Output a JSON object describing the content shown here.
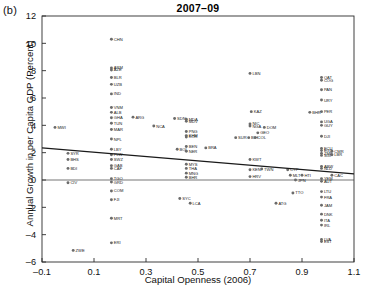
{
  "panel": {
    "label": "(b)"
  },
  "chart_data": {
    "type": "scatter",
    "title": "2007–09",
    "xlabel": "Capital Openness (2006)",
    "ylabel": "Annual Growth in per Capita GDP (Percent)",
    "xlim": [
      -0.1,
      1.1
    ],
    "ylim": [
      -6,
      12
    ],
    "xticks": [
      "–0.1",
      "0.1",
      "0.3",
      "0.5",
      "0.7",
      "0.9",
      "1.1"
    ],
    "xtick_values": [
      -0.1,
      0.1,
      0.3,
      0.5,
      0.7,
      0.9,
      1.1
    ],
    "yticks": [
      "12",
      "10",
      "8",
      "6",
      "4",
      "2",
      "0",
      "–2",
      "–4",
      "–6"
    ],
    "ytick_values": [
      12,
      10,
      8,
      6,
      4,
      2,
      0,
      -2,
      -4,
      -6
    ],
    "grid": false,
    "legend": null,
    "marker_color": "#6b6b6b",
    "line_color": "#1a1a1a",
    "trendline": {
      "x0": -0.1,
      "y0": 2.35,
      "x1": 1.1,
      "y1": 0.45
    },
    "zero_line": {
      "y": 0
    },
    "points": [
      {
        "label": "CHN",
        "x": 0.167,
        "y": 10.3
      },
      {
        "label": "ARM",
        "x": 0.167,
        "y": 8.2
      },
      {
        "label": "AZE",
        "x": 0.167,
        "y": 8.05
      },
      {
        "label": "BLR",
        "x": 0.167,
        "y": 7.5
      },
      {
        "label": "UZB",
        "x": 0.167,
        "y": 7.0
      },
      {
        "label": "IND",
        "x": 0.167,
        "y": 6.3
      },
      {
        "label": "VNM",
        "x": 0.167,
        "y": 5.3
      },
      {
        "label": "ALB",
        "x": 0.167,
        "y": 4.95
      },
      {
        "label": "GHA",
        "x": 0.167,
        "y": 4.55
      },
      {
        "label": "TUN",
        "x": 0.167,
        "y": 4.15
      },
      {
        "label": "MAR",
        "x": 0.167,
        "y": 3.7
      },
      {
        "label": "NPL",
        "x": 0.167,
        "y": 3.0
      },
      {
        "label": "ARG",
        "x": 0.25,
        "y": 4.6
      },
      {
        "label": "NCA",
        "x": 0.33,
        "y": 3.95
      },
      {
        "label": "LBY",
        "x": 0.167,
        "y": 2.25
      },
      {
        "label": "PLW",
        "x": 0.167,
        "y": 1.85
      },
      {
        "label": "SWZ",
        "x": 0.167,
        "y": 1.5
      },
      {
        "label": "GAB",
        "x": 0.167,
        "y": 1.05
      },
      {
        "label": "CAF",
        "x": 0.167,
        "y": 0.85
      },
      {
        "label": "TGO",
        "x": 0.167,
        "y": 0.1
      },
      {
        "label": "GRD",
        "x": 0.167,
        "y": -0.15
      },
      {
        "label": "COM",
        "x": 0.167,
        "y": -0.8
      },
      {
        "label": "FJI",
        "x": 0.167,
        "y": -1.45
      },
      {
        "label": "MRT",
        "x": 0.167,
        "y": -2.8
      },
      {
        "label": "ERI",
        "x": 0.167,
        "y": -4.6
      },
      {
        "label": "SYR",
        "x": 0.0,
        "y": 1.95
      },
      {
        "label": "BHS",
        "x": 0.0,
        "y": 1.5
      },
      {
        "label": "BDI",
        "x": 0.0,
        "y": 0.85
      },
      {
        "label": "CIV",
        "x": 0.0,
        "y": -0.2
      },
      {
        "label": "MWI",
        "x": -0.05,
        "y": 3.85
      },
      {
        "label": "ZWE",
        "x": 0.02,
        "y": -5.15
      },
      {
        "label": "SDN",
        "x": 0.41,
        "y": 4.5
      },
      {
        "label": "MDA",
        "x": 0.455,
        "y": 4.45
      },
      {
        "label": "MDV",
        "x": 0.455,
        "y": 4.3
      },
      {
        "label": "PNG",
        "x": 0.455,
        "y": 3.55
      },
      {
        "label": "KHM",
        "x": 0.455,
        "y": 3.25
      },
      {
        "label": "KOR",
        "x": 0.455,
        "y": 3.15
      },
      {
        "label": "BEN",
        "x": 0.455,
        "y": 2.45
      },
      {
        "label": "BOL",
        "x": 0.42,
        "y": 2.25
      },
      {
        "label": "NER",
        "x": 0.455,
        "y": 2.1
      },
      {
        "label": "BRA",
        "x": 0.53,
        "y": 2.35
      },
      {
        "label": "MYS",
        "x": 0.455,
        "y": 1.15
      },
      {
        "label": "THA",
        "x": 0.455,
        "y": 0.85
      },
      {
        "label": "MNG",
        "x": 0.455,
        "y": 0.5
      },
      {
        "label": "BHR",
        "x": 0.455,
        "y": 0.2
      },
      {
        "label": "SYC",
        "x": 0.43,
        "y": -1.35
      },
      {
        "label": "LCA",
        "x": 0.47,
        "y": -1.7
      },
      {
        "label": "LBN",
        "x": 0.7,
        "y": 7.8
      },
      {
        "label": "KAZ",
        "x": 0.705,
        "y": 5.0
      },
      {
        "label": "NIC",
        "x": 0.7,
        "y": 4.1
      },
      {
        "label": "NGA",
        "x": 0.7,
        "y": 3.95
      },
      {
        "label": "DOM",
        "x": 0.755,
        "y": 3.85
      },
      {
        "label": "GEO",
        "x": 0.73,
        "y": 3.45
      },
      {
        "label": "SUR",
        "x": 0.645,
        "y": 3.1
      },
      {
        "label": "BIH",
        "x": 0.695,
        "y": 3.1
      },
      {
        "label": "COL",
        "x": 0.72,
        "y": 3.1
      },
      {
        "label": "KWT",
        "x": 0.7,
        "y": 1.5
      },
      {
        "label": "KEN",
        "x": 0.7,
        "y": 0.75
      },
      {
        "label": "TWN",
        "x": 0.745,
        "y": 0.8
      },
      {
        "label": "HRV",
        "x": 0.7,
        "y": 0.25
      },
      {
        "label": "CYP",
        "x": 0.845,
        "y": 0.75
      },
      {
        "label": "MLT",
        "x": 0.855,
        "y": 0.35
      },
      {
        "label": "HTI",
        "x": 0.9,
        "y": 0.35
      },
      {
        "label": "JPN",
        "x": 0.875,
        "y": 0.0
      },
      {
        "label": "TTO",
        "x": 0.865,
        "y": -0.95
      },
      {
        "label": "ATG",
        "x": 0.8,
        "y": -1.7
      },
      {
        "label": "QAT",
        "x": 0.975,
        "y": 7.5
      },
      {
        "label": "COG",
        "x": 0.975,
        "y": 7.3
      },
      {
        "label": "PAN",
        "x": 0.975,
        "y": 6.6
      },
      {
        "label": "URY",
        "x": 0.975,
        "y": 5.85
      },
      {
        "label": "PER",
        "x": 0.975,
        "y": 5.0
      },
      {
        "label": "BHR",
        "x": 0.93,
        "y": 4.95
      },
      {
        "label": "UGA",
        "x": 0.975,
        "y": 4.25
      },
      {
        "label": "GUY",
        "x": 0.975,
        "y": 4.0
      },
      {
        "label": "DJI",
        "x": 0.975,
        "y": 3.2
      },
      {
        "label": "ECU",
        "x": 0.975,
        "y": 2.3
      },
      {
        "label": "EGY",
        "x": 0.975,
        "y": 2.15
      },
      {
        "label": "ZMB",
        "x": 0.975,
        "y": 1.95
      },
      {
        "label": "SGP",
        "x": 0.975,
        "y": 1.8
      },
      {
        "label": "CMR",
        "x": 1.015,
        "y": 2.1
      },
      {
        "label": "LBR",
        "x": 1.015,
        "y": 1.85
      },
      {
        "label": "ABW",
        "x": 0.975,
        "y": 1.0
      },
      {
        "label": "NLD",
        "x": 0.975,
        "y": 0.85
      },
      {
        "label": "CAC",
        "x": 1.015,
        "y": 0.35
      },
      {
        "label": "YEM",
        "x": 0.975,
        "y": 0.1
      },
      {
        "label": "AUT",
        "x": 0.975,
        "y": -0.1
      },
      {
        "label": "LTU",
        "x": 0.975,
        "y": -0.85
      },
      {
        "label": "FRA",
        "x": 0.975,
        "y": -1.25
      },
      {
        "label": "JAM",
        "x": 0.975,
        "y": -1.85
      },
      {
        "label": "DNK",
        "x": 0.975,
        "y": -2.5
      },
      {
        "label": "ITA",
        "x": 0.975,
        "y": -2.95
      },
      {
        "label": "IRL",
        "x": 0.975,
        "y": -3.3
      },
      {
        "label": "LVA",
        "x": 0.975,
        "y": -4.35
      },
      {
        "label": "EST",
        "x": 0.975,
        "y": -4.5
      }
    ]
  }
}
